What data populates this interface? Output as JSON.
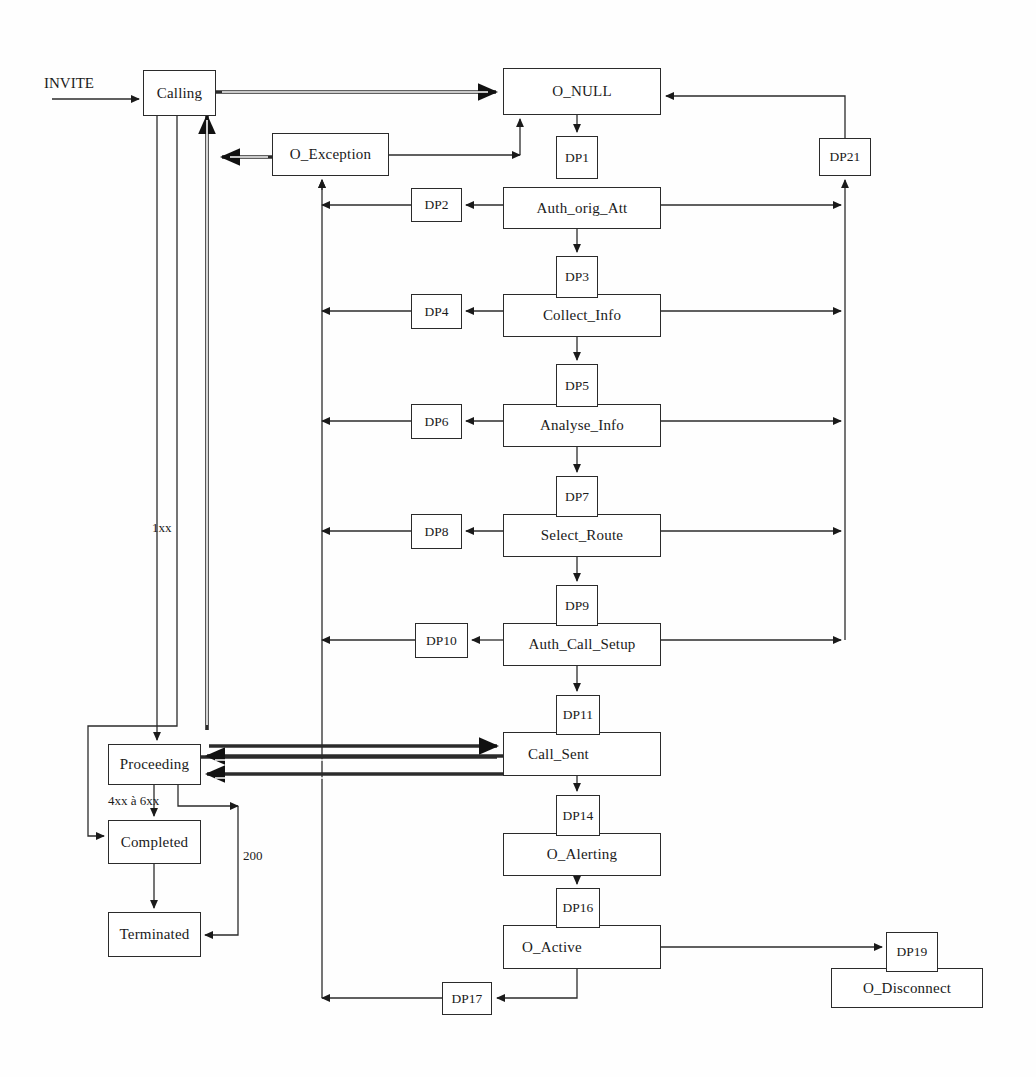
{
  "diagram": {
    "type": "state-transition-diagram",
    "stroke_color": "#2b2b2b",
    "background": "#ffffff"
  },
  "states": [
    {
      "id": "calling",
      "label": "Calling",
      "x": 143,
      "y": 70,
      "w": 73,
      "h": 46
    },
    {
      "id": "o_null",
      "label": "O_NULL",
      "x": 503,
      "y": 68,
      "w": 158,
      "h": 47
    },
    {
      "id": "o_exception",
      "label": "O_Exception",
      "x": 272,
      "y": 133,
      "w": 117,
      "h": 43
    },
    {
      "id": "auth_orig_att",
      "label": "Auth_orig_Att",
      "x": 503,
      "y": 187,
      "w": 158,
      "h": 42
    },
    {
      "id": "collect_info",
      "label": "Collect_Info",
      "x": 503,
      "y": 294,
      "w": 158,
      "h": 43
    },
    {
      "id": "analyse_info",
      "label": "Analyse_Info",
      "x": 503,
      "y": 404,
      "w": 158,
      "h": 43
    },
    {
      "id": "select_route",
      "label": "Select_Route",
      "x": 503,
      "y": 514,
      "w": 158,
      "h": 43
    },
    {
      "id": "auth_call_setup",
      "label": "Auth_Call_Setup",
      "x": 503,
      "y": 623,
      "w": 158,
      "h": 43
    },
    {
      "id": "call_sent",
      "label": "Call_Sent",
      "x": 503,
      "y": 732,
      "w": 158,
      "h": 44
    },
    {
      "id": "o_alerting",
      "label": "O_Alerting",
      "x": 503,
      "y": 833,
      "w": 158,
      "h": 43
    },
    {
      "id": "o_active",
      "label": "O_Active",
      "x": 503,
      "y": 925,
      "w": 158,
      "h": 44
    },
    {
      "id": "o_disconnect",
      "label": "O_Disconnect",
      "x": 831,
      "y": 968,
      "w": 152,
      "h": 40
    },
    {
      "id": "proceeding",
      "label": "Proceeding",
      "x": 108,
      "y": 744,
      "w": 93,
      "h": 41
    },
    {
      "id": "completed",
      "label": "Completed",
      "x": 108,
      "y": 820,
      "w": 93,
      "h": 44
    },
    {
      "id": "terminated",
      "label": "Terminated",
      "x": 108,
      "y": 912,
      "w": 93,
      "h": 45
    }
  ],
  "detection_points": [
    {
      "id": "dp1",
      "label": "DP1",
      "x": 556,
      "y": 136,
      "w": 42,
      "h": 43
    },
    {
      "id": "dp2",
      "label": "DP2",
      "x": 411,
      "y": 188,
      "w": 51,
      "h": 34
    },
    {
      "id": "dp3",
      "label": "DP3",
      "x": 556,
      "y": 256,
      "w": 42,
      "h": 42
    },
    {
      "id": "dp4",
      "label": "DP4",
      "x": 411,
      "y": 294,
      "w": 51,
      "h": 35
    },
    {
      "id": "dp5",
      "label": "DP5",
      "x": 556,
      "y": 364,
      "w": 42,
      "h": 43
    },
    {
      "id": "dp6",
      "label": "DP6",
      "x": 411,
      "y": 404,
      "w": 51,
      "h": 35
    },
    {
      "id": "dp7",
      "label": "DP7",
      "x": 556,
      "y": 476,
      "w": 42,
      "h": 41
    },
    {
      "id": "dp8",
      "label": "DP8",
      "x": 411,
      "y": 514,
      "w": 51,
      "h": 35
    },
    {
      "id": "dp9",
      "label": "DP9",
      "x": 556,
      "y": 585,
      "w": 42,
      "h": 41
    },
    {
      "id": "dp10",
      "label": "DP10",
      "x": 415,
      "y": 623,
      "w": 53,
      "h": 35
    },
    {
      "id": "dp11",
      "label": "DP11",
      "x": 556,
      "y": 695,
      "w": 44,
      "h": 40
    },
    {
      "id": "dp14",
      "label": "DP14",
      "x": 556,
      "y": 795,
      "w": 44,
      "h": 41
    },
    {
      "id": "dp16",
      "label": "DP16",
      "x": 556,
      "y": 888,
      "w": 44,
      "h": 40
    },
    {
      "id": "dp17",
      "label": "DP17",
      "x": 442,
      "y": 982,
      "w": 50,
      "h": 33
    },
    {
      "id": "dp19",
      "label": "DP19",
      "x": 886,
      "y": 932,
      "w": 52,
      "h": 40
    },
    {
      "id": "dp21",
      "label": "DP21",
      "x": 819,
      "y": 138,
      "w": 52,
      "h": 38
    }
  ],
  "edge_labels": [
    {
      "id": "invite",
      "label": "INVITE",
      "x": 44,
      "y": 75,
      "size": "big"
    },
    {
      "id": "one_xx",
      "label": "1xx",
      "x": 152,
      "y": 520,
      "size": "small"
    },
    {
      "id": "four_six",
      "label": "4xx à 6xx",
      "x": 108,
      "y": 793,
      "size": "small"
    },
    {
      "id": "two_hund",
      "label": "200",
      "x": 243,
      "y": 848,
      "size": "small"
    }
  ],
  "flows": {
    "main_chain": [
      "O_NULL",
      "DP1",
      "Auth_orig_Att",
      "DP3",
      "Collect_Info",
      "DP5",
      "Analyse_Info",
      "DP7",
      "Select_Route",
      "DP9",
      "Auth_Call_Setup",
      "DP11",
      "Call_Sent",
      "DP14",
      "O_Alerting",
      "DP16",
      "O_Active"
    ],
    "exception_chain": [
      "DP2",
      "DP4",
      "DP6",
      "DP8",
      "DP10",
      "DP17",
      "O_Exception"
    ],
    "return_bus": [
      "Auth_orig_Att",
      "Collect_Info",
      "Analyse_Info",
      "Select_Route",
      "Auth_Call_Setup",
      "DP21",
      "O_NULL"
    ],
    "sip_chain": [
      "INVITE",
      "Calling",
      "Proceeding",
      "Completed",
      "Terminated"
    ],
    "disconnect_chain": [
      "O_Active",
      "DP19",
      "O_Disconnect"
    ]
  }
}
